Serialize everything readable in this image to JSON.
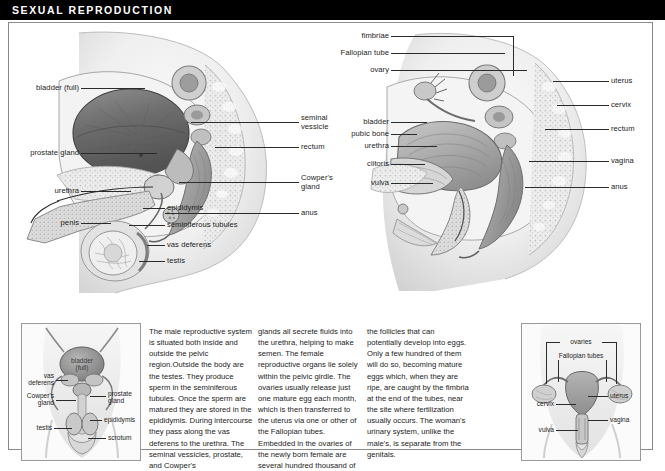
{
  "header": {
    "title": "SEXUAL REPRODUCTION"
  },
  "male_diagram": {
    "name": "male-reproductive-system-sagittal",
    "labels_left": [
      {
        "text": "bladder (full)",
        "name": "label-bladder-full"
      },
      {
        "text": "prostate gland",
        "name": "label-prostate-gland"
      },
      {
        "text": "urethra",
        "name": "label-urethra"
      },
      {
        "text": "penis",
        "name": "label-penis"
      }
    ],
    "labels_inner": [
      {
        "text": "epididymis",
        "name": "label-epididymis"
      },
      {
        "text": "seminiferous tubules",
        "name": "label-seminiferous-tubules"
      },
      {
        "text": "vas deferens",
        "name": "label-vas-deferens"
      },
      {
        "text": "testis",
        "name": "label-testis"
      }
    ],
    "labels_right": [
      {
        "text": "seminal\nvessicle",
        "name": "label-seminal-vessicle"
      },
      {
        "text": "rectum",
        "name": "label-rectum"
      },
      {
        "text": "Cowper's\ngland",
        "name": "label-cowpers-gland"
      },
      {
        "text": "anus",
        "name": "label-anus"
      }
    ]
  },
  "female_diagram": {
    "name": "female-reproductive-system-sagittal",
    "labels_left": [
      {
        "text": "fimbriae",
        "name": "label-fimbriae"
      },
      {
        "text": "Fallopian tube",
        "name": "label-fallopian-tube"
      },
      {
        "text": "ovary",
        "name": "label-ovary"
      },
      {
        "text": "bladder",
        "name": "label-bladder"
      },
      {
        "text": "pubic bone",
        "name": "label-pubic-bone"
      },
      {
        "text": "urethra",
        "name": "label-urethra-female"
      },
      {
        "text": "clitoris",
        "name": "label-clitoris"
      },
      {
        "text": "vulva",
        "name": "label-vulva"
      }
    ],
    "labels_right": [
      {
        "text": "uterus",
        "name": "label-uterus"
      },
      {
        "text": "cervix",
        "name": "label-cervix"
      },
      {
        "text": "rectum",
        "name": "label-rectum-female"
      },
      {
        "text": "vagina",
        "name": "label-vagina"
      },
      {
        "text": "anus",
        "name": "label-anus-female"
      }
    ]
  },
  "body_text": {
    "col1": "The male reproductive system is situated both inside and outside the pelvic region.Outside the body are the testes. They produce sperm in the seminiferous tubules. Once the sperm are matured they are stored in the epididymis. During intercourse they pass along the vas deferens to the urethra. The seminal vessicles, prostate, and Cowper's",
    "col2": "glands all secrete fluids into the urethra, helping to make semen. The female reproductive organs lie solely within the pelvic girdle. The ovaries usually release just one mature egg each month, which is then transferred to the uterus via one or other of the Fallopian tubes. Embedded in the ovaries of the newly born female are several hundred thousand of",
    "col3": "the follicles that can potentially develop into eggs. Only a few hundred of them will do so, becoming mature eggs which, when they are ripe, are caught by the fimbria at the end of the tubes, near the site where fertilization usually occurs. The woman's urinary system, unlike the male's, is separate from the genitals."
  },
  "inset_male": {
    "name": "male-reproductive-organs-frontal",
    "center_label": "bladder\n(full)",
    "labels_left": [
      {
        "text": "vas\ndeferens",
        "name": "inset-label-vas-deferens"
      },
      {
        "text": "Cowper's\ngland",
        "name": "inset-label-cowpers-gland"
      },
      {
        "text": "testis",
        "name": "inset-label-testis"
      }
    ],
    "labels_right": [
      {
        "text": "prostate\ngland",
        "name": "inset-label-prostate-gland"
      },
      {
        "text": "epididymis",
        "name": "inset-label-epididymis"
      },
      {
        "text": "scrotum",
        "name": "inset-label-scrotum"
      }
    ]
  },
  "inset_female": {
    "name": "female-reproductive-organs-frontal",
    "labels_top": [
      {
        "text": "ovaries",
        "name": "inset-label-ovaries"
      },
      {
        "text": "Fallopian tubes",
        "name": "inset-label-fallopian-tubes"
      }
    ],
    "labels_left": [
      {
        "text": "cervix",
        "name": "inset-label-cervix"
      },
      {
        "text": "vulva",
        "name": "inset-label-vulva"
      }
    ],
    "labels_right": [
      {
        "text": "uterus",
        "name": "inset-label-uterus"
      },
      {
        "text": "vagina",
        "name": "inset-label-vagina"
      }
    ]
  },
  "colors": {
    "header_bg": "#000000",
    "header_text": "#ffffff",
    "frame_border": "#8a8a8a",
    "body_text": "#232323",
    "leader_line": "#2b2b2b"
  }
}
